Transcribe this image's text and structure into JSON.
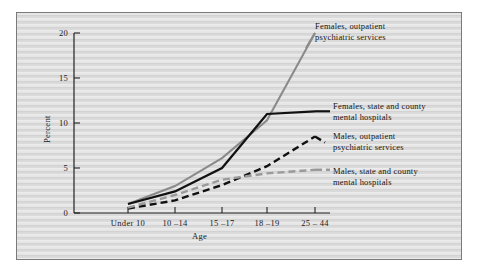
{
  "figure": {
    "background_color": "#d9d9d9",
    "border_color": "#7a7a7a"
  },
  "chart_data": {
    "type": "line",
    "title": "",
    "xlabel": "Age",
    "ylabel": "Percent",
    "categories": [
      "Under 10",
      "10 –14",
      "15 –17",
      "18 –19",
      "25 – 44"
    ],
    "xtick_labels": [
      "Under 10",
      "10 –14",
      "15 –17",
      "18 –19",
      "25 – 44"
    ],
    "ytick_labels": [
      "0",
      "5",
      "10",
      "15",
      "20"
    ],
    "ytick_values": [
      0,
      5,
      10,
      15,
      20
    ],
    "ylim": [
      0,
      20
    ],
    "grid": false,
    "legend_position": "right-inline-annotations",
    "series": [
      {
        "name": "Females, outpatient psychiatric services",
        "label_line1": "Females, outpatient",
        "label_line2": "psychiatric services",
        "values": [
          1.0,
          3.0,
          6.1,
          10.3,
          20.0
        ],
        "color": "#8a8a8a",
        "style": "solid",
        "width": 2.0
      },
      {
        "name": "Females, state and county mental hospitals",
        "label_line1": "Females, state and county",
        "label_line2": "mental hospitals",
        "values": [
          1.0,
          2.4,
          5.0,
          11.0,
          11.3
        ],
        "color": "#111111",
        "style": "solid",
        "width": 2.2
      },
      {
        "name": "Males, outpatient psychiatric services",
        "label_line1": "Males, outpatient",
        "label_line2": "psychiatric services",
        "values": [
          0.5,
          1.4,
          3.1,
          5.2,
          8.5
        ],
        "color": "#111111",
        "style": "dashed",
        "width": 2.4
      },
      {
        "name": "Males, state and county mental hospitals",
        "label_line1": "Males, state and county",
        "label_line2": "mental hospitals",
        "values": [
          0.6,
          2.0,
          3.7,
          4.4,
          4.8
        ],
        "color": "#9a9a9a",
        "style": "dashed",
        "width": 2.4
      }
    ]
  }
}
